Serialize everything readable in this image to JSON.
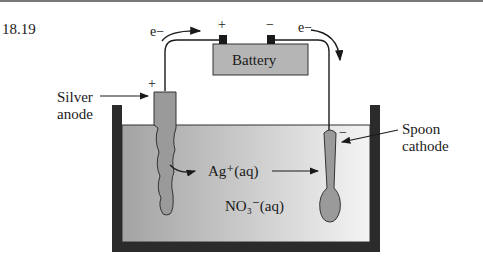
{
  "figure": {
    "number": "18.19",
    "battery": {
      "label": "Battery",
      "positive_sign": "+",
      "negative_sign": "−"
    },
    "electron_labels": [
      "e−",
      "e−"
    ],
    "anode": {
      "label_line1": "Silver",
      "label_line2": "anode",
      "sign": "+"
    },
    "cathode": {
      "label_line1": "Spoon",
      "label_line2": "cathode",
      "sign": "−"
    },
    "ion_cation": "Ag⁺(aq)",
    "ion_anion": "NO₃⁻(aq)"
  },
  "colors": {
    "container": "#2b2b2b",
    "solution_left": "#a8a8a8",
    "solution_right": "#f2f2f2",
    "electrode": "#9a9a9a",
    "battery": "#b5b5b5"
  }
}
